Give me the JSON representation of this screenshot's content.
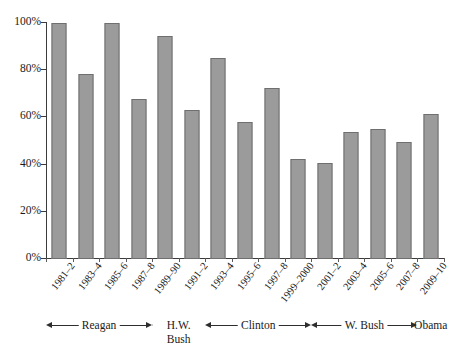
{
  "chart_data": {
    "type": "bar",
    "title": "",
    "subtitle": "",
    "xlabel": "",
    "ylabel": "",
    "ylim": [
      0,
      100
    ],
    "grid": false,
    "legend": null,
    "value_suffix": "%",
    "categories": [
      "1981–2",
      "1983–4",
      "1985–6",
      "1987–8",
      "1989–90",
      "1991–2",
      "1993–4",
      "1995–6",
      "1997–8",
      "1999–2000",
      "2001–2",
      "2003–4",
      "2005–6",
      "2007–8",
      "2009–10"
    ],
    "values": [
      100,
      78.5,
      100,
      68,
      94.5,
      63,
      85,
      58,
      72.5,
      42.5,
      40.5,
      54,
      55,
      49.5,
      61.5
    ],
    "y_ticks": [
      0,
      20,
      40,
      60,
      80,
      100
    ],
    "y_tick_labels": [
      "0%",
      "20%",
      "40%",
      "60%",
      "80%",
      "100%"
    ],
    "annotations": [
      {
        "label": "Reagan",
        "start_index": 0,
        "end_index": 3,
        "two_line": false
      },
      {
        "label": "H.W. Bush",
        "start_index": 4,
        "end_index": 5,
        "two_line": true
      },
      {
        "label": "Clinton",
        "start_index": 6,
        "end_index": 9,
        "two_line": false
      },
      {
        "label": "W. Bush",
        "start_index": 10,
        "end_index": 13,
        "two_line": false
      },
      {
        "label": "Obama",
        "start_index": 14,
        "end_index": 14,
        "two_line": false
      }
    ],
    "colors": {
      "bar_fill": "#9b9b9b",
      "bar_border": "#6f6f6f",
      "axis": "#3b3b3b",
      "text": "#1a1a1a",
      "background": "#ffffff"
    }
  }
}
